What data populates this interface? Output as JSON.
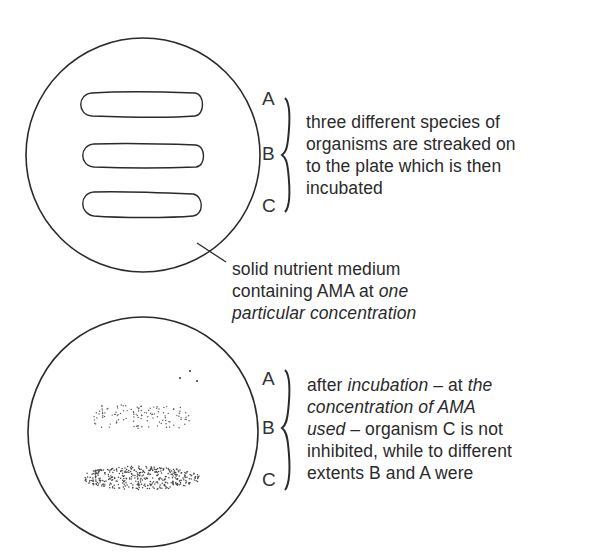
{
  "figure": {
    "top_plate": {
      "labels": [
        "A",
        "B",
        "C"
      ],
      "caption": [
        "three different species of",
        "organisms are streaked on",
        "to the plate which is then",
        "incubated"
      ],
      "medium_caption": {
        "line1": "solid nutrient medium",
        "line2_normal": "containing AMA at ",
        "line2_italic": "one",
        "line3_italic": "particular concentration"
      }
    },
    "bottom_plate": {
      "labels": [
        "A",
        "B",
        "C"
      ],
      "caption": {
        "l1_normal_a": "after ",
        "l1_italic_a": "incubation",
        "l1_normal_b": " – at ",
        "l1_italic_b": "the",
        "l2_italic": "concentration of AMA",
        "l3_italic": "used",
        "l3_normal": " – organism C is not",
        "l4": "inhibited, while to different",
        "l5": "extents B and A were"
      }
    },
    "colors": {
      "ink": "#2a2a2a",
      "background": "#ffffff"
    }
  }
}
